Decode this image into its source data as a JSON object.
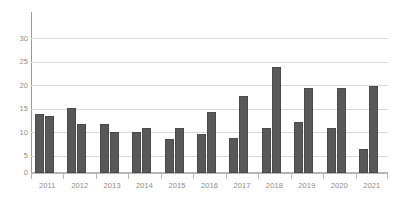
{
  "chart_data": {
    "type": "bar",
    "title": "",
    "subtitle": "",
    "xlabel": "",
    "ylabel": "",
    "categories": [
      "2011",
      "2012",
      "2013",
      "2014",
      "2015",
      "2016",
      "2017",
      "2018",
      "2019",
      "2020",
      "2021"
    ],
    "series": [
      {
        "name": "series-1",
        "values": [
          13.2,
          14.5,
          10.9,
          9.1,
          7.6,
          8.7,
          7.7,
          10.1,
          11.3,
          9.9,
          5.4
        ]
      },
      {
        "name": "series-2",
        "values": [
          12.7,
          10.8,
          9.2,
          10.0,
          10.0,
          13.6,
          17.2,
          23.5,
          18.9,
          18.8,
          19.4
        ]
      }
    ],
    "ylim": [
      0,
      32
    ],
    "yticks": [
      0,
      5,
      10,
      15,
      20,
      25,
      30
    ],
    "ytick_labels": [
      "0",
      "5",
      "10",
      "15",
      "20",
      "25",
      "30"
    ],
    "grid": true,
    "grid_axis": "y",
    "legend": false,
    "legend_position": "none",
    "annotations": [],
    "colors": {
      "bar_fill": "#585858",
      "bar_stroke": "#4a4a4a",
      "gridline": "#d9d9d9",
      "axis_line": "#b5b5b5",
      "y_axis_line": "#9a9a9a",
      "tick_label": "#8d8d8d",
      "background": "#ffffff"
    }
  }
}
